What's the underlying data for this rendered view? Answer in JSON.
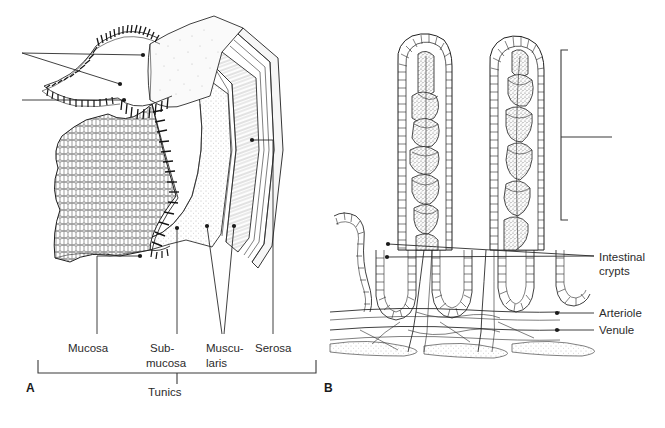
{
  "figure": {
    "background_color": "#ffffff",
    "ink_color": "#1f1f1f",
    "label_color": "#2b2b2b"
  },
  "panels": [
    {
      "id": "A",
      "letter": "A",
      "name": "intestinal-wall-cut-away",
      "description": "Cut-away block of intestinal wall showing the four tunics"
    },
    {
      "id": "B",
      "letter": "B",
      "name": "villi-and-crypts",
      "description": "Intestinal villi with capillary networks, crypts, arteriole and venule"
    }
  ],
  "panel_a": {
    "tunic_labels": [
      {
        "name": "mucosa",
        "lines": [
          "Mucosa"
        ],
        "x": 68,
        "y": 348
      },
      {
        "name": "submucosa",
        "lines": [
          "Sub-",
          "mucosa"
        ],
        "x": 148,
        "y": 348
      },
      {
        "name": "muscularis",
        "lines": [
          "Muscu-",
          "laris"
        ],
        "x": 205,
        "y": 348
      },
      {
        "name": "serosa",
        "lines": [
          "Serosa"
        ],
        "x": 253,
        "y": 348
      }
    ],
    "group_bracket": {
      "name": "tunics-bracket",
      "label": "Tunics",
      "label_x": 148,
      "label_y": 392,
      "left": 38,
      "right": 316,
      "y": 368
    }
  },
  "panel_b": {
    "callout_labels": [
      {
        "name": "intestinal-crypts",
        "lines": [
          "Intestinal",
          "crypts"
        ],
        "x": 599,
        "y": 258
      },
      {
        "name": "arteriole",
        "lines": [
          "Arteriole"
        ],
        "x": 599,
        "y": 317
      },
      {
        "name": "venule",
        "lines": [
          "Venule"
        ],
        "x": 599,
        "y": 334
      }
    ],
    "villus_bracket": {
      "name": "villus-bracket",
      "label": "",
      "top": 50,
      "bottom": 220,
      "x": 561,
      "leader_y": 137,
      "leader_end": 612
    }
  }
}
